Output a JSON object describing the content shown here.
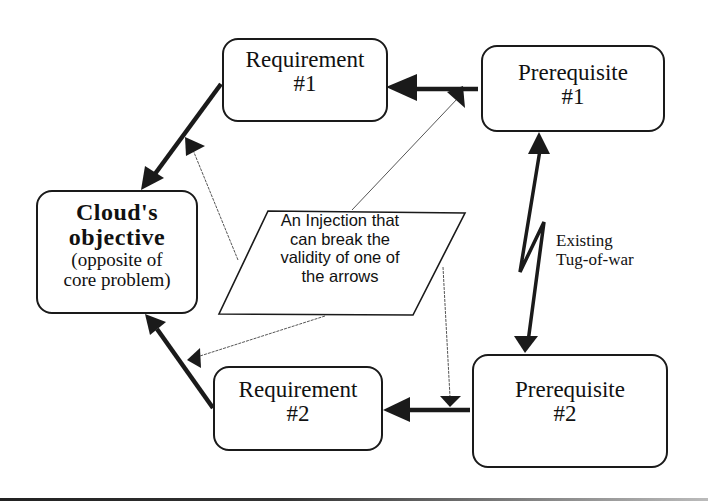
{
  "diagram": {
    "type": "evaporating-cloud",
    "nodes": {
      "objective": {
        "title": "Cloud's",
        "title2": "objective",
        "subtitle1": "(opposite of",
        "subtitle2": "core problem)"
      },
      "requirement1": {
        "title": "Requirement",
        "num": "#1"
      },
      "requirement2": {
        "title": "Requirement",
        "num": "#2"
      },
      "prerequisite1": {
        "title": "Prerequisite",
        "num": "#1"
      },
      "prerequisite2": {
        "title": "Prerequisite",
        "num": "#2"
      },
      "injection": {
        "line1": "An Injection that",
        "line2": "can break the",
        "line3": "validity of one of",
        "line4": "the arrows"
      }
    },
    "conflict_label": {
      "line1": "Existing",
      "line2": "Tug-of-war"
    },
    "edges": [
      {
        "from": "requirement1",
        "to": "objective",
        "style": "thick"
      },
      {
        "from": "requirement2",
        "to": "objective",
        "style": "thick"
      },
      {
        "from": "prerequisite1",
        "to": "requirement1",
        "style": "thick"
      },
      {
        "from": "prerequisite2",
        "to": "requirement2",
        "style": "thick"
      },
      {
        "from": "prerequisite1",
        "to": "prerequisite2",
        "style": "conflict-bidirectional"
      },
      {
        "from": "injection",
        "to": "edge:requirement1-objective",
        "style": "thin-dashed"
      },
      {
        "from": "injection",
        "to": "edge:requirement2-objective",
        "style": "thin-dashed"
      },
      {
        "from": "injection",
        "to": "edge:prerequisite1-requirement1",
        "style": "thin-dashed"
      },
      {
        "from": "injection",
        "to": "edge:prerequisite2-requirement2",
        "style": "thin-dashed"
      }
    ],
    "colors": {
      "line": "#1a1a1a",
      "thin_line": "#555555",
      "background": "#ffffff"
    }
  }
}
